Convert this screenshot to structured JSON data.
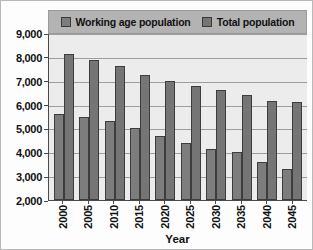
{
  "chart_data": {
    "type": "bar",
    "title": "",
    "xlabel": "Year",
    "ylabel": "",
    "categories": [
      "2000",
      "2005",
      "2010",
      "2015",
      "2020",
      "2025",
      "2030",
      "2035",
      "2040",
      "2045"
    ],
    "series": [
      {
        "name": "Working age population",
        "swatch_color": "#7d7d7d",
        "values": [
          5600,
          5500,
          5300,
          5000,
          4700,
          4400,
          4150,
          4000,
          3600,
          3300
        ]
      },
      {
        "name": "Total population",
        "swatch_color": "#757575",
        "values": [
          8100,
          7850,
          7600,
          7250,
          7000,
          6800,
          6600,
          6400,
          6150,
          6100
        ]
      }
    ],
    "ylim": [
      2000,
      9000
    ],
    "y_ticks": [
      "2,000",
      "3,000",
      "4,000",
      "5,000",
      "6,000",
      "7,000",
      "8,000",
      "9,000"
    ],
    "y_tick_values": [
      2000,
      3000,
      4000,
      5000,
      6000,
      7000,
      8000,
      9000
    ],
    "grid": true,
    "legend_position": "top"
  },
  "legend": {
    "entries": [
      {
        "label": "Working age population"
      },
      {
        "label": "Total population"
      }
    ]
  },
  "axis": {
    "x_title": "Year"
  }
}
